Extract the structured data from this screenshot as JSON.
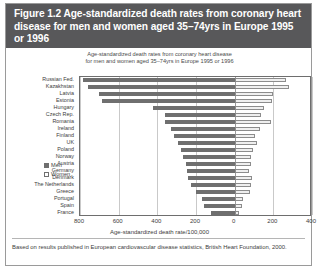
{
  "figure": {
    "title": "Figure 1.2  Age-standardized death rates from coronary heart disease for men and women aged 35–74yrs in Europe 1995 or 1996",
    "source_note": "Based on results published in European cardiovascular disease statistics, British Heart Foundation, 2000."
  },
  "legend": {
    "men_label": "Men",
    "women_label": "Women"
  },
  "colors": {
    "title_bar": "#58585a",
    "men_bar": "#6f6f6f",
    "women_bar": "#efefef",
    "women_bar_border": "#8c8c8c",
    "gridline": "#c9c9c9",
    "frame": "#6e6e6e"
  },
  "chart_data": {
    "type": "bar",
    "orientation": "horizontal-diverging",
    "title": "Age-standardized death rates from coronary heart disease for men and women aged 35–74yrs in Europe 1995 or 1996",
    "subtitle_line1": "Age-standardized death rates from coronary heart disease",
    "subtitle_line2": "for men and women aged 35–74yrs in Europe 1995 or 1996",
    "xlabel": "Age-standardized death rate/100,000",
    "ylabel": "",
    "xlim": [
      -800,
      400
    ],
    "xticks": [
      -800,
      -600,
      -400,
      -200,
      0,
      200,
      400
    ],
    "xticklabels": [
      "800",
      "600",
      "400",
      "200",
      "0",
      "200",
      "400"
    ],
    "grid": true,
    "legend_position": "inside-lower-left",
    "categories": [
      "Russian Fed.",
      "Kazakhstan",
      "Latvia",
      "Estonia",
      "Hungary",
      "Czech Rep.",
      "Romania",
      "Ireland",
      "Finland",
      "UK",
      "Poland",
      "Norway",
      "Austria",
      "Germany",
      "Denmark",
      "The Netherlands",
      "Greece",
      "Portugal",
      "Spain",
      "France"
    ],
    "series": [
      {
        "name": "Men",
        "direction": "left",
        "values": [
          783,
          760,
          703,
          687,
          425,
          360,
          360,
          327,
          315,
          295,
          280,
          268,
          252,
          245,
          240,
          228,
          200,
          167,
          160,
          120
        ]
      },
      {
        "name": "Women",
        "direction": "right",
        "values": [
          263,
          280,
          200,
          195,
          150,
          135,
          190,
          130,
          105,
          115,
          95,
          85,
          82,
          75,
          90,
          85,
          78,
          45,
          37,
          22
        ]
      }
    ]
  }
}
